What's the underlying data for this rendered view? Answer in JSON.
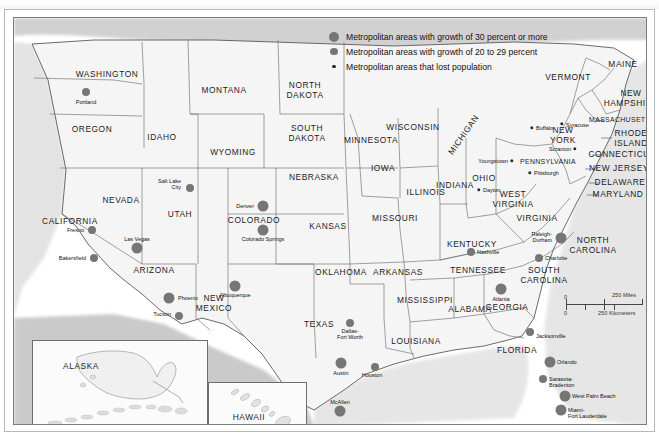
{
  "document": {
    "type": "thematic-map",
    "region": "United States",
    "cut_off_header_text": ""
  },
  "legend": {
    "items": [
      {
        "symbol": "large-gray-dot",
        "label": "Metropolitan areas with growth of 30 percent or more"
      },
      {
        "symbol": "medium-gray-dot",
        "label": "Metropolitan areas with growth of 20 to 29 percent"
      },
      {
        "symbol": "small-dark-dot",
        "label": "Metropolitan areas that lost population"
      }
    ]
  },
  "scale_bar": {
    "miles_zero": "0",
    "miles_label": "250 Miles",
    "km_zero": "0",
    "km_label": "250 Kilometers"
  },
  "insets": [
    {
      "name": "ALASKA"
    },
    {
      "name": "HAWAII"
    }
  ],
  "states": [
    {
      "name": "WASHINGTON",
      "x": 93,
      "y": 57
    },
    {
      "name": "OREGON",
      "x": 78,
      "y": 112
    },
    {
      "name": "IDAHO",
      "x": 148,
      "y": 120
    },
    {
      "name": "MONTANA",
      "x": 210,
      "y": 73
    },
    {
      "name": "WYOMING",
      "x": 219,
      "y": 135
    },
    {
      "name": "NEVADA",
      "x": 107,
      "y": 183
    },
    {
      "name": "UTAH",
      "x": 166,
      "y": 197
    },
    {
      "name": "CALIFORNIA",
      "x": 56,
      "y": 204
    },
    {
      "name": "ARIZONA",
      "x": 140,
      "y": 253
    },
    {
      "name": "NEW\nMEXICO",
      "x": 200,
      "y": 285
    },
    {
      "name": "COLORADO",
      "x": 240,
      "y": 203
    },
    {
      "name": "NORTH\nDAKOTA",
      "x": 291,
      "y": 72
    },
    {
      "name": "SOUTH\nDAKOTA",
      "x": 293,
      "y": 115
    },
    {
      "name": "NEBRASKA",
      "x": 300,
      "y": 160
    },
    {
      "name": "KANSAS",
      "x": 314,
      "y": 209
    },
    {
      "name": "OKLAHOMA",
      "x": 327,
      "y": 255
    },
    {
      "name": "TEXAS",
      "x": 305,
      "y": 307
    },
    {
      "name": "MINNESOTA",
      "x": 357,
      "y": 123
    },
    {
      "name": "IOWA",
      "x": 369,
      "y": 151
    },
    {
      "name": "MISSOURI",
      "x": 381,
      "y": 201
    },
    {
      "name": "ARKANSAS",
      "x": 384,
      "y": 255
    },
    {
      "name": "LOUISIANA",
      "x": 402,
      "y": 324
    },
    {
      "name": "WISCONSIN",
      "x": 399,
      "y": 110
    },
    {
      "name": "ILLINOIS",
      "x": 412,
      "y": 175
    },
    {
      "name": "MISSISSIPPI",
      "x": 411,
      "y": 283
    },
    {
      "name": "MICHIGAN",
      "x": 450,
      "y": 117
    },
    {
      "name": "INDIANA",
      "x": 441,
      "y": 168
    },
    {
      "name": "OHIO",
      "x": 470,
      "y": 161
    },
    {
      "name": "KENTUCKY",
      "x": 458,
      "y": 227
    },
    {
      "name": "TENNESSEE",
      "x": 464,
      "y": 253
    },
    {
      "name": "ALABAMA",
      "x": 456,
      "y": 292
    },
    {
      "name": "GEORGIA",
      "x": 493,
      "y": 290
    },
    {
      "name": "FLORIDA",
      "x": 503,
      "y": 333
    },
    {
      "name": "WEST\nVIRGINIA",
      "x": 499,
      "y": 181
    },
    {
      "name": "VIRGINIA",
      "x": 523,
      "y": 201
    },
    {
      "name": "NORTH\nCAROLINA",
      "x": 579,
      "y": 227
    },
    {
      "name": "SOUTH\nCAROLINA",
      "x": 530,
      "y": 257
    },
    {
      "name": "PENNSYLVANIA",
      "x": 534,
      "y": 144
    },
    {
      "name": "NEW\nYORK",
      "x": 549,
      "y": 117
    },
    {
      "name": "VERMONT",
      "x": 554,
      "y": 60
    },
    {
      "name": "MAINE",
      "x": 609,
      "y": 47
    },
    {
      "name": "NEW\nHAMPSHIRE",
      "x": 617,
      "y": 80
    },
    {
      "name": "MASSACHUSETTS",
      "x": 608,
      "y": 102
    },
    {
      "name": "RHODE\nISLAND",
      "x": 617,
      "y": 120
    },
    {
      "name": "CONNECTICUT",
      "x": 608,
      "y": 137
    },
    {
      "name": "NEW JERSEY",
      "x": 605,
      "y": 151
    },
    {
      "name": "DELAWARE",
      "x": 606,
      "y": 165
    },
    {
      "name": "MARYLAND",
      "x": 604,
      "y": 177
    }
  ],
  "cities": [
    {
      "name": "Portland",
      "class": "g20",
      "x": 72,
      "y": 74,
      "lx": 72,
      "ly": 84,
      "align": "center"
    },
    {
      "name": "Salt Lake\nCity",
      "class": "g20",
      "x": 176,
      "y": 170,
      "lx": 167,
      "ly": 166,
      "align": "left"
    },
    {
      "name": "Fresno",
      "class": "g20",
      "x": 78,
      "y": 212,
      "lx": 70,
      "ly": 212,
      "align": "left"
    },
    {
      "name": "Bakersfield",
      "class": "g20",
      "x": 80,
      "y": 240,
      "lx": 72,
      "ly": 240,
      "align": "left"
    },
    {
      "name": "Las Vegas",
      "class": "g30",
      "x": 123,
      "y": 230,
      "lx": 123,
      "ly": 221,
      "align": "center"
    },
    {
      "name": "Phoenix",
      "class": "g30",
      "x": 155,
      "y": 280,
      "lx": 164,
      "ly": 280,
      "align": "right"
    },
    {
      "name": "Tucson",
      "class": "g20",
      "x": 165,
      "y": 298,
      "lx": 157,
      "ly": 296,
      "align": "left"
    },
    {
      "name": "Albuquerque",
      "class": "g30",
      "x": 221,
      "y": 268,
      "lx": 221,
      "ly": 277,
      "align": "center"
    },
    {
      "name": "Denver",
      "class": "g30",
      "x": 249,
      "y": 188,
      "lx": 240,
      "ly": 188,
      "align": "left"
    },
    {
      "name": "Colorado Springs",
      "class": "g30",
      "x": 249,
      "y": 212,
      "lx": 249,
      "ly": 221,
      "align": "center"
    },
    {
      "name": "Dallas-\nFort Worth",
      "class": "g20",
      "x": 336,
      "y": 305,
      "lx": 336,
      "ly": 316,
      "align": "center"
    },
    {
      "name": "Austin",
      "class": "g30",
      "x": 327,
      "y": 345,
      "lx": 327,
      "ly": 355,
      "align": "center"
    },
    {
      "name": "Houston",
      "class": "g20",
      "x": 361,
      "y": 349,
      "lx": 358,
      "ly": 357,
      "align": "center"
    },
    {
      "name": "McAllen",
      "class": "g30",
      "x": 326,
      "y": 393,
      "lx": 326,
      "ly": 384,
      "align": "center"
    },
    {
      "name": "Nashville",
      "class": "g20",
      "x": 457,
      "y": 234,
      "lx": 463,
      "ly": 234,
      "align": "right"
    },
    {
      "name": "Atlanta",
      "class": "g30",
      "x": 487,
      "y": 271,
      "lx": 487,
      "ly": 281,
      "align": "center"
    },
    {
      "name": "Jacksonville",
      "class": "g20",
      "x": 516,
      "y": 314,
      "lx": 522,
      "ly": 318,
      "align": "right"
    },
    {
      "name": "Orlando",
      "class": "g30",
      "x": 536,
      "y": 344,
      "lx": 543,
      "ly": 344,
      "align": "right"
    },
    {
      "name": "Sarasota-\nBradenton",
      "class": "g20",
      "x": 529,
      "y": 361,
      "lx": 535,
      "ly": 364,
      "align": "right"
    },
    {
      "name": "West Palm Beach",
      "class": "g30",
      "x": 551,
      "y": 378,
      "lx": 558,
      "ly": 378,
      "align": "right"
    },
    {
      "name": "Miami-\nFort Lauderdale",
      "class": "g30",
      "x": 547,
      "y": 392,
      "lx": 554,
      "ly": 395,
      "align": "right"
    },
    {
      "name": "Charlotte",
      "class": "g20",
      "x": 525,
      "y": 240,
      "lx": 531,
      "ly": 240,
      "align": "right"
    },
    {
      "name": "Raleigh-\nDurham",
      "class": "g30",
      "x": 547,
      "y": 220,
      "lx": 538,
      "ly": 219,
      "align": "left"
    },
    {
      "name": "Buffalo",
      "class": "lost",
      "x": 518,
      "y": 110,
      "lx": 522,
      "ly": 110,
      "align": "right"
    },
    {
      "name": "Syracuse",
      "class": "lost",
      "x": 548,
      "y": 106,
      "lx": 552,
      "ly": 107,
      "align": "right"
    },
    {
      "name": "Scranton",
      "class": "lost",
      "x": 561,
      "y": 131,
      "lx": 557,
      "ly": 131,
      "align": "left"
    },
    {
      "name": "Pittsburgh",
      "class": "lost",
      "x": 516,
      "y": 155,
      "lx": 520,
      "ly": 155,
      "align": "right"
    },
    {
      "name": "Youngstown",
      "class": "lost",
      "x": 498,
      "y": 143,
      "lx": 494,
      "ly": 143,
      "align": "left"
    },
    {
      "name": "Dayton",
      "class": "lost",
      "x": 465,
      "y": 172,
      "lx": 469,
      "ly": 172,
      "align": "right"
    }
  ]
}
